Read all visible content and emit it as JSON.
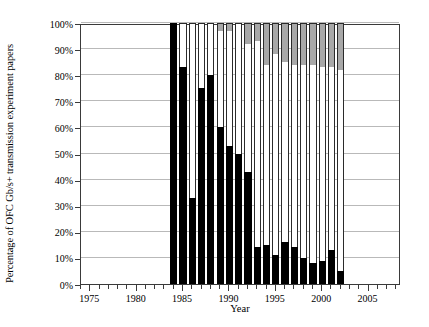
{
  "axes": {
    "ylabel": "Percentage of OFC Gb/s+ transmission experiment papers",
    "xlabel": "Year",
    "yticks": [
      "0%",
      "10%",
      "20%",
      "30%",
      "40%",
      "50%",
      "60%",
      "70%",
      "80%",
      "90%",
      "100%"
    ],
    "xticks_major": [
      "1975",
      "1980",
      "1985",
      "1990",
      "1995",
      "2000",
      "2005"
    ]
  },
  "chart_data": {
    "type": "bar",
    "title": "",
    "subtitle": "",
    "xlabel": "Year",
    "ylabel": "Percentage of OFC Gb/s+ transmission experiment papers",
    "stacked": true,
    "stack_total": 100,
    "xlim": [
      1974,
      2008.5
    ],
    "ylim": [
      0,
      100
    ],
    "ytick_values": [
      0,
      10,
      20,
      30,
      40,
      50,
      60,
      70,
      80,
      90,
      100
    ],
    "ytick_labels": [
      "0%",
      "10%",
      "20%",
      "30%",
      "40%",
      "50%",
      "60%",
      "70%",
      "80%",
      "90%",
      "100%"
    ],
    "xtick_major_values": [
      1975,
      1980,
      1985,
      1990,
      1995,
      2000,
      2005
    ],
    "xtick_major_labels": [
      "1975",
      "1980",
      "1985",
      "1990",
      "1995",
      "2000",
      "2005"
    ],
    "xtick_minor_step": 1,
    "grid": "horizontal",
    "legend": "none",
    "colors": {
      "segment_black": "#000000",
      "segment_white": "#ffffff",
      "segment_gray": "#a8a8a8",
      "gridline": "#b9b9b9",
      "axis": "#3a3a3a"
    },
    "categories": [
      1984,
      1985,
      1986,
      1987,
      1988,
      1989,
      1990,
      1991,
      1992,
      1993,
      1994,
      1995,
      1996,
      1997,
      1998,
      1999,
      2000,
      2001,
      2002
    ],
    "series": [
      {
        "name": "black",
        "values": [
          100,
          83,
          33,
          75,
          80,
          60,
          53,
          50,
          43,
          14,
          15,
          11,
          16,
          14,
          10,
          8,
          9,
          13,
          5
        ]
      },
      {
        "name": "white",
        "values": [
          0,
          17,
          67,
          25,
          20,
          37,
          44,
          50,
          49,
          79,
          69,
          77,
          69,
          70,
          74,
          76,
          74,
          70,
          77
        ]
      },
      {
        "name": "gray",
        "values": [
          0,
          0,
          0,
          0,
          0,
          3,
          3,
          0,
          8,
          7,
          16,
          12,
          15,
          16,
          16,
          16,
          17,
          17,
          18
        ]
      }
    ]
  }
}
